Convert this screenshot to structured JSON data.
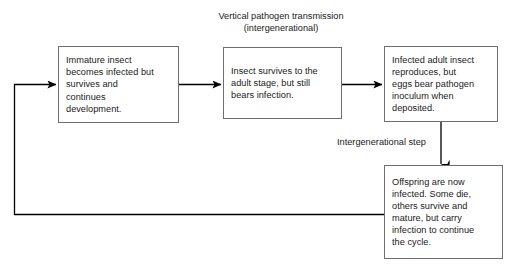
{
  "diagram": {
    "title_line1": "Vertical pathogen transmission",
    "title_line2": "(intergenerational)",
    "title": "Vertical pathogen transmission\n(intergenerational)",
    "step_label": "Intergenerational step",
    "stroke_color": "#6e6e6e",
    "arrow_color": "#000000",
    "text_color": "#1a1a1a",
    "background_color": "#ffffff",
    "nodes": [
      {
        "id": "immature",
        "text": "Immature insect\nbecomes infected but\nsurvives and\ncontinues\ndevelopment."
      },
      {
        "id": "adult",
        "text": "Insect survives to the\nadult stage, but still\nbears infection."
      },
      {
        "id": "reproduce",
        "text": "Infected adult insect\nreproduces, but\neggs bear pathogen\ninoculum when\ndeposited."
      },
      {
        "id": "offspring",
        "text": "Offspring are now\ninfected. Some die,\nothers survive and\nmature, but carry\ninfection to continue\nthe cycle."
      }
    ],
    "connectors": [
      {
        "id": "immature-to-adult",
        "from": "immature",
        "to": "adult",
        "arrow": true
      },
      {
        "id": "adult-to-reproduce",
        "from": "adult",
        "to": "reproduce",
        "arrow": true
      },
      {
        "id": "reproduce-to-offspring",
        "from": "reproduce",
        "to": "offspring",
        "arrow": true
      },
      {
        "id": "offspring-to-immature",
        "from": "offspring",
        "to": "immature",
        "arrow": true
      }
    ]
  }
}
